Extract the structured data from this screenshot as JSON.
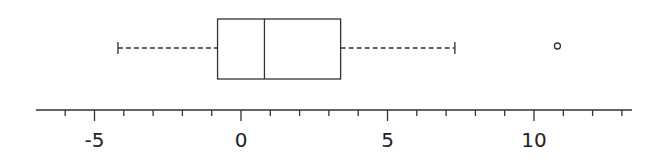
{
  "chart_data": {
    "type": "boxplot",
    "orientation": "horizontal",
    "title": "",
    "xlabel": "",
    "ylabel": "",
    "xlim": [
      -7,
      13.5
    ],
    "major_ticks": [
      -5,
      0,
      5,
      10
    ],
    "tick_labels": [
      "-5",
      "0",
      "5",
      "10"
    ],
    "minor_tick_step": 1,
    "grid": false,
    "series": [
      {
        "name": "",
        "whisker_low": -4.2,
        "q1": -0.8,
        "median": 0.8,
        "q3": 3.4,
        "whisker_high": 7.3,
        "outliers": [
          10.8
        ]
      }
    ]
  },
  "colors": {
    "line": "#333333",
    "background": "#ffffff"
  }
}
